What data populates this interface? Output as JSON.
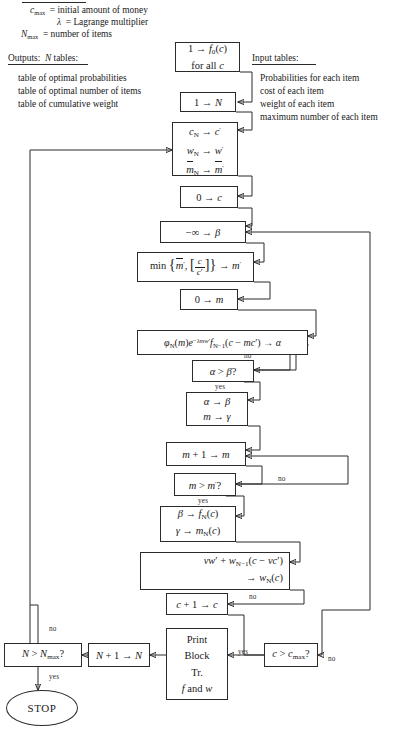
{
  "legend": {
    "inputs_rule": true,
    "input_lines": [
      {
        "sym": "c",
        "sub": "max",
        "text": "= initial amount of money"
      },
      {
        "sym": "λ",
        "sub": "",
        "text": "= Lagrange multiplier"
      },
      {
        "sym": "N",
        "sub": "max",
        "text": "= number of items"
      }
    ],
    "outputs_heading": "Outputs:  N tables:",
    "outputs_items": [
      "table of optimal probabilities",
      "table of optimal number of items",
      "table of cumulative weight"
    ],
    "input_tables_heading": "Input tables:",
    "input_tables_items": [
      "Probabilities for each item",
      "cost of each item",
      "weight of each item",
      "maximum number of each item"
    ]
  },
  "nodes": {
    "init_f0": {
      "line1": "1 → f0(c)",
      "line2": "for all c"
    },
    "init_N": {
      "text": "1 → N"
    },
    "load_item": {
      "l1": "cN → c′",
      "l2": "wN → w′",
      "l3": "m̄N → m̄′"
    },
    "zero_c": {
      "text": "0 → c"
    },
    "neg_inf": {
      "text": "−∞ → β"
    },
    "min_box": {
      "text": "min { m̄′ , [ c / c′ ] } → m′"
    },
    "zero_m": {
      "text": "0 → m"
    },
    "phi": {
      "text": "φN(m) e^(−λmw′) fN−1(c − mc′) → α"
    },
    "test_ab": {
      "text": "α > β?"
    },
    "assign_bg": {
      "l1": "α → β",
      "l2": "m → γ"
    },
    "inc_m": {
      "text": "m + 1 → m"
    },
    "test_mm": {
      "text": "m > m′?"
    },
    "store_fm": {
      "l1": "β → fN(c)",
      "l2": "γ → mN(c)"
    },
    "weight": {
      "l1": "vw′ + wN−1(c − vc′)",
      "l2": "→ wN(c)"
    },
    "inc_c": {
      "text": "c + 1 → c"
    },
    "test_cmax": {
      "text": "c > cmax?"
    },
    "print": {
      "l1": "Print",
      "l2": "Block",
      "l3": "Tr.",
      "l4": "f and w"
    },
    "inc_N": {
      "text": "N + 1 → N"
    },
    "test_Nmax": {
      "text": "N > Nmax?"
    },
    "stop": {
      "text": "STOP"
    }
  },
  "edge_labels": {
    "ab_no": "no",
    "ab_yes": "yes",
    "mm_no": "no",
    "mm_yes": "yes",
    "c_no": "no",
    "cmax_yes": "yes",
    "cmax_no": "no",
    "N_no": "no",
    "N_yes": "yes"
  },
  "colors": {
    "ink": "#2b2b2b",
    "paper": "#ffffff"
  }
}
